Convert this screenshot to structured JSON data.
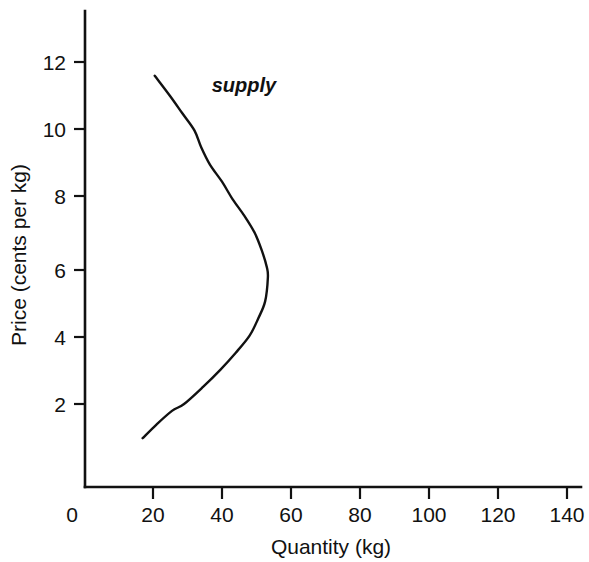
{
  "chart_data": {
    "type": "line",
    "title": "",
    "subtitle": "",
    "xlabel": "Quantity (kg)",
    "ylabel": "Price (cents per kg)",
    "xlim": [
      0,
      148
    ],
    "ylim": [
      0,
      13.2
    ],
    "grid": false,
    "legend_position": "inline-annotation",
    "x_ticks": [
      0,
      20,
      40,
      60,
      80,
      100,
      120,
      140
    ],
    "x_tick_labels": [
      "0",
      "20",
      "40",
      "60",
      "80",
      "100",
      "120",
      "140"
    ],
    "y_ticks": [
      2,
      4,
      6,
      8,
      10,
      12
    ],
    "y_tick_labels": [
      "2",
      "4",
      "6",
      "8",
      "10",
      "12"
    ],
    "annotations": [
      {
        "text": "supply",
        "x": 37,
        "y": 11.3,
        "style": "italic"
      }
    ],
    "series": [
      {
        "name": "supply",
        "description": "backward-bending supply curve",
        "points": [
          {
            "q": 17.0,
            "p": 1.0
          },
          {
            "q": 21.0,
            "p": 1.4
          },
          {
            "q": 25.5,
            "p": 1.8
          },
          {
            "q": 29.0,
            "p": 2.0
          },
          {
            "q": 34.5,
            "p": 2.5
          },
          {
            "q": 39.5,
            "p": 3.0
          },
          {
            "q": 44.0,
            "p": 3.5
          },
          {
            "q": 48.0,
            "p": 4.0
          },
          {
            "q": 50.5,
            "p": 4.5
          },
          {
            "q": 52.5,
            "p": 5.0
          },
          {
            "q": 53.3,
            "p": 5.7
          },
          {
            "q": 53.0,
            "p": 6.0
          },
          {
            "q": 51.5,
            "p": 6.5
          },
          {
            "q": 49.5,
            "p": 7.0
          },
          {
            "q": 46.5,
            "p": 7.5
          },
          {
            "q": 43.0,
            "p": 8.0
          },
          {
            "q": 40.0,
            "p": 8.5
          },
          {
            "q": 36.5,
            "p": 9.0
          },
          {
            "q": 34.0,
            "p": 9.5
          },
          {
            "q": 32.0,
            "p": 10.0
          },
          {
            "q": 28.5,
            "p": 10.5
          },
          {
            "q": 25.0,
            "p": 11.0
          },
          {
            "q": 20.5,
            "p": 11.6
          }
        ],
        "max_quantity_point": {
          "q": 53.3,
          "p": 5.7
        },
        "lower_endpoint": {
          "q": 17.0,
          "p": 1.0
        },
        "upper_endpoint": {
          "q": 20.5,
          "p": 11.6
        }
      }
    ],
    "colors": {
      "background": "#ffffff",
      "axis": "#111111",
      "curve": "#111111",
      "text": "#111111"
    }
  }
}
